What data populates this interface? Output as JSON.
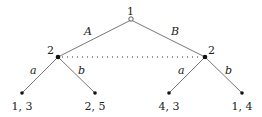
{
  "diagram": {
    "type": "extensive-form game tree",
    "root": {
      "player": "1"
    },
    "player2_nodes": [
      {
        "player": "2"
      },
      {
        "player": "2"
      }
    ],
    "actions_player1": [
      "A",
      "B"
    ],
    "actions_player2_left": [
      "a",
      "b"
    ],
    "actions_player2_right": [
      "a",
      "b"
    ],
    "payoffs": [
      "1, 3",
      "2, 5",
      "4, 3",
      "1, 4"
    ],
    "information_set": "dotted line connecting player 2 nodes"
  }
}
